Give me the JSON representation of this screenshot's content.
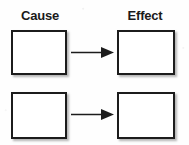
{
  "document": {
    "title": "Cause and Effect Graphic Organizer",
    "background_color": "#ffffff",
    "ink_color": "#1c1c1c"
  },
  "headings": {
    "cause": "Cause",
    "effect": "Effect"
  },
  "rows": [
    {
      "cause_box": {
        "label": "",
        "value": "",
        "placeholder": ""
      },
      "arrow": {
        "symbol": "→",
        "direction": "right"
      },
      "effect_box": {
        "label": "",
        "value": "",
        "placeholder": ""
      }
    },
    {
      "cause_box": {
        "label": "",
        "value": "",
        "placeholder": ""
      },
      "arrow": {
        "symbol": "→",
        "direction": "right"
      },
      "effect_box": {
        "label": "",
        "value": "",
        "placeholder": ""
      }
    }
  ]
}
